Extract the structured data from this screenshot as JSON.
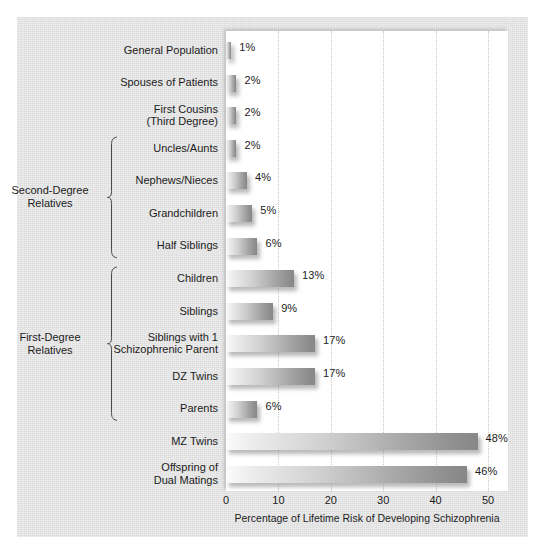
{
  "chart_data": {
    "type": "bar",
    "orientation": "horizontal",
    "title": "",
    "xlabel": "Percentage of Lifetime Risk of Developing Schizophrenia",
    "ylabel": "",
    "xlim": [
      0,
      53
    ],
    "xticks": [
      0,
      10,
      20,
      30,
      40,
      50
    ],
    "xtick_labels": [
      "0",
      "10",
      "20",
      "30",
      "40",
      "50"
    ],
    "grid": "vertical-dotted",
    "legend": "none",
    "value_suffix": "%",
    "categories": [
      "General Population",
      "Spouses of Patients",
      "First Cousins\n(Third Degree)",
      "Uncles/Aunts",
      "Nephews/Nieces",
      "Grandchildren",
      "Half Siblings",
      "Children",
      "Siblings",
      "Siblings with 1\nSchizophrenic Parent",
      "DZ Twins",
      "Parents",
      "MZ Twins",
      "Offspring of\nDual Matings"
    ],
    "values": [
      1,
      2,
      2,
      2,
      4,
      5,
      6,
      13,
      9,
      17,
      17,
      6,
      48,
      46
    ],
    "value_labels": [
      "1%",
      "2%",
      "2%",
      "2%",
      "4%",
      "5%",
      "6%",
      "13%",
      "9%",
      "17%",
      "17%",
      "6%",
      "48%",
      "46%"
    ],
    "groups": [
      {
        "label": "Second-Degree\nRelatives",
        "first_index": 3,
        "last_index": 6
      },
      {
        "label": "First-Degree\nRelatives",
        "first_index": 7,
        "last_index": 11
      }
    ]
  },
  "colors": {
    "figure_background": "#e3e3e3",
    "plot_background": "#ffffff",
    "bar_light": "#fbfbfb",
    "bar_dark": "#878787",
    "gridline": "#c9c9c9",
    "text": "#1c1c1c"
  }
}
